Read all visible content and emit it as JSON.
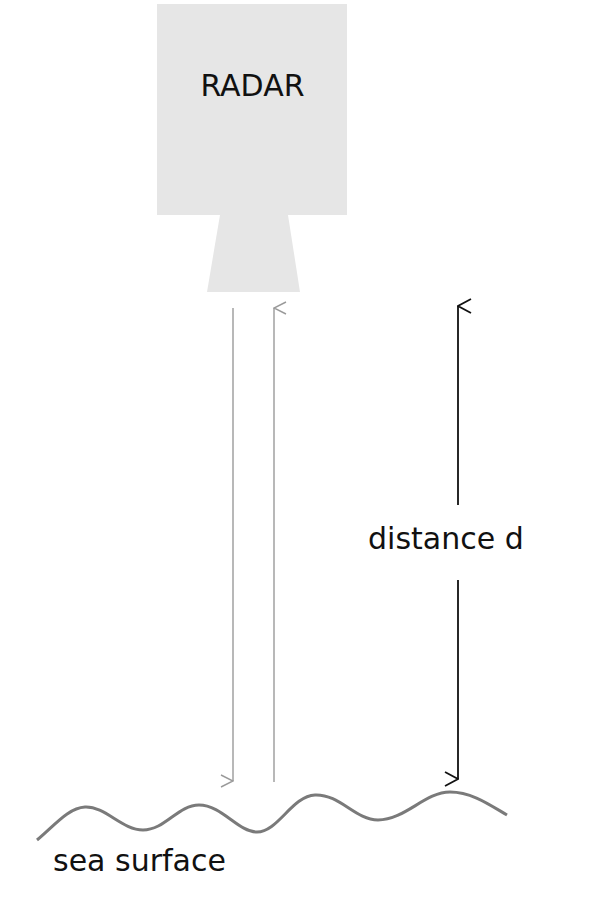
{
  "diagram": {
    "radar": {
      "label": "RADAR",
      "fill": "#e6e6e6"
    },
    "distance": {
      "label": "distance d",
      "color": "#111111"
    },
    "sea": {
      "label": "sea surface",
      "color": "#7a7a7a"
    },
    "beams": {
      "color": "#9a9a9a",
      "transmitted": "down",
      "reflected": "up"
    }
  }
}
